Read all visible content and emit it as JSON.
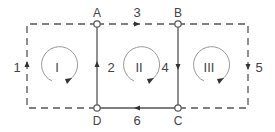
{
  "diagram": {
    "type": "circuit-loop-diagram",
    "colors": {
      "line": "#555555",
      "text": "#444444",
      "node_fill": "#ffffff"
    },
    "nodes": [
      {
        "id": "A",
        "label": "A"
      },
      {
        "id": "B",
        "label": "B"
      },
      {
        "id": "C",
        "label": "C"
      },
      {
        "id": "D",
        "label": "D"
      }
    ],
    "branches": [
      {
        "id": "1",
        "label": "1",
        "style": "dashed",
        "direction": "up"
      },
      {
        "id": "2",
        "label": "2",
        "style": "solid",
        "from": "D",
        "to": "A",
        "direction": "up"
      },
      {
        "id": "3",
        "label": "3",
        "style": "dashed",
        "from": "A",
        "to": "B",
        "direction": "right"
      },
      {
        "id": "4",
        "label": "4",
        "style": "solid",
        "from": "B",
        "to": "C",
        "direction": "down"
      },
      {
        "id": "5",
        "label": "5",
        "style": "dashed",
        "direction": "down"
      },
      {
        "id": "6",
        "label": "6",
        "style": "solid",
        "from": "C",
        "to": "D",
        "direction": "left"
      }
    ],
    "loops": [
      {
        "id": "I",
        "label": "I",
        "direction": "clockwise"
      },
      {
        "id": "II",
        "label": "II",
        "direction": "clockwise"
      },
      {
        "id": "III",
        "label": "III",
        "direction": "clockwise"
      }
    ]
  }
}
